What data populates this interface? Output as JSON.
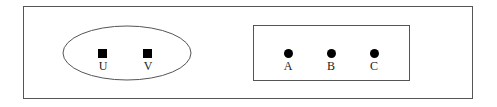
{
  "diagram": {
    "left_group": {
      "shape": "ellipse",
      "nodes": [
        {
          "label": "U",
          "marker": "square"
        },
        {
          "label": "V",
          "marker": "square"
        }
      ]
    },
    "right_group": {
      "shape": "rectangle",
      "nodes": [
        {
          "label": "A",
          "marker": "circle"
        },
        {
          "label": "B",
          "marker": "circle"
        },
        {
          "label": "C",
          "marker": "circle"
        }
      ]
    },
    "colors": {
      "stroke": "#555555",
      "marker": "#000000",
      "background": "#ffffff"
    }
  }
}
